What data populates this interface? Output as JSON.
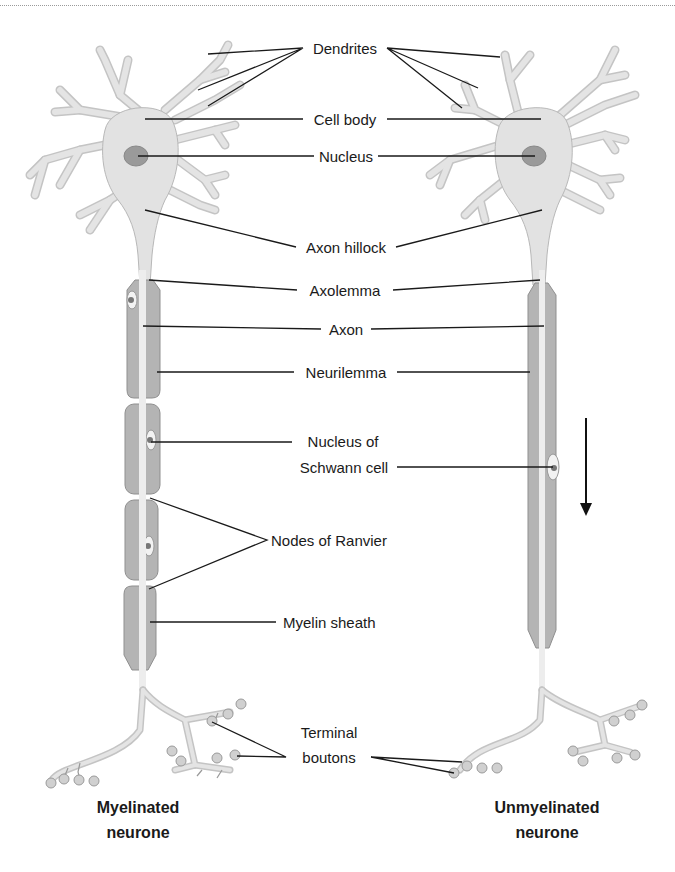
{
  "figure": {
    "labels": {
      "dendrites": "Dendrites",
      "cell_body": "Cell body",
      "nucleus": "Nucleus",
      "axon_hillock": "Axon hillock",
      "axolemma": "Axolemma",
      "axon": "Axon",
      "neurilemma": "Neurilemma",
      "nucleus_of_schwann_cell_line1": "Nucleus of",
      "nucleus_of_schwann_cell_line2": "Schwann cell",
      "nodes_of_ranvier": "Nodes of Ranvier",
      "myelin_sheath": "Myelin sheath",
      "terminal_boutons_line1": "Terminal",
      "terminal_boutons_line2": "boutons"
    },
    "captions": {
      "left_line1": "Myelinated",
      "left_line2": "neurone",
      "right_line1": "Unmyelinated",
      "right_line2": "neurone"
    },
    "icons": {
      "impulse_direction": "arrow-down-icon"
    },
    "colors": {
      "tissue": "#e2e2e2",
      "sheath": "#b4b4b4",
      "nucleus": "#9a9a9a",
      "line": "#1a1a1a"
    }
  }
}
